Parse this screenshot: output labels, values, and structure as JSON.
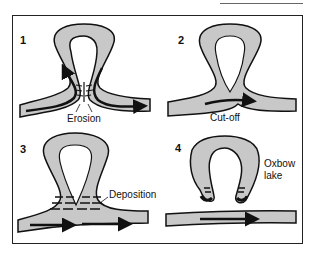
{
  "diagram": {
    "colors": {
      "river": "#c8c8c8",
      "outline": "#111111",
      "background": "#ffffff"
    },
    "panels": [
      {
        "number": "1",
        "label": "Erosion"
      },
      {
        "number": "2",
        "label": "Cut-off"
      },
      {
        "number": "3",
        "label": "Deposition"
      },
      {
        "number": "4",
        "label": "Oxbow lake",
        "label_lines": [
          "Oxbow",
          "lake"
        ]
      }
    ]
  }
}
